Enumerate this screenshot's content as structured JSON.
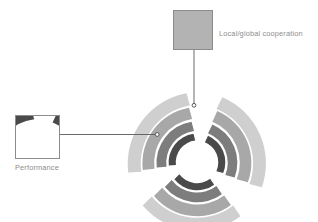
{
  "diagram": {
    "title": "",
    "background_color": "#ffffff",
    "connector_color": "#5a5a5a",
    "caption_color": "#8e8e8e",
    "thumbnail_border_color": "#8c8c8c"
  },
  "callouts": [
    {
      "id": "performance",
      "label": "Performance",
      "thumbnail_name": "performance-detail-thumbnail",
      "connector": "horizontal-line-with-endpoint-dot",
      "endpoint_marker": "circle"
    },
    {
      "id": "local-global-cooperation",
      "label": "Local/global cooperation",
      "thumbnail_name": "cooperation-detail-thumbnail",
      "connector": "vertical-line-with-endpoint-dot",
      "endpoint_marker": "circle"
    }
  ],
  "main_graphic": {
    "name": "radial-arc-pinwheel",
    "symmetry": "3-fold rotational, 120 degrees",
    "arc_groups": 3,
    "arcs_per_group": 4,
    "palette": [
      "#cfcfcf",
      "#a8a8a8",
      "#7d7d7d",
      "#4a4a4a"
    ],
    "palette_names": [
      "light-grey",
      "mid-grey",
      "dark-grey",
      "charcoal"
    ]
  }
}
